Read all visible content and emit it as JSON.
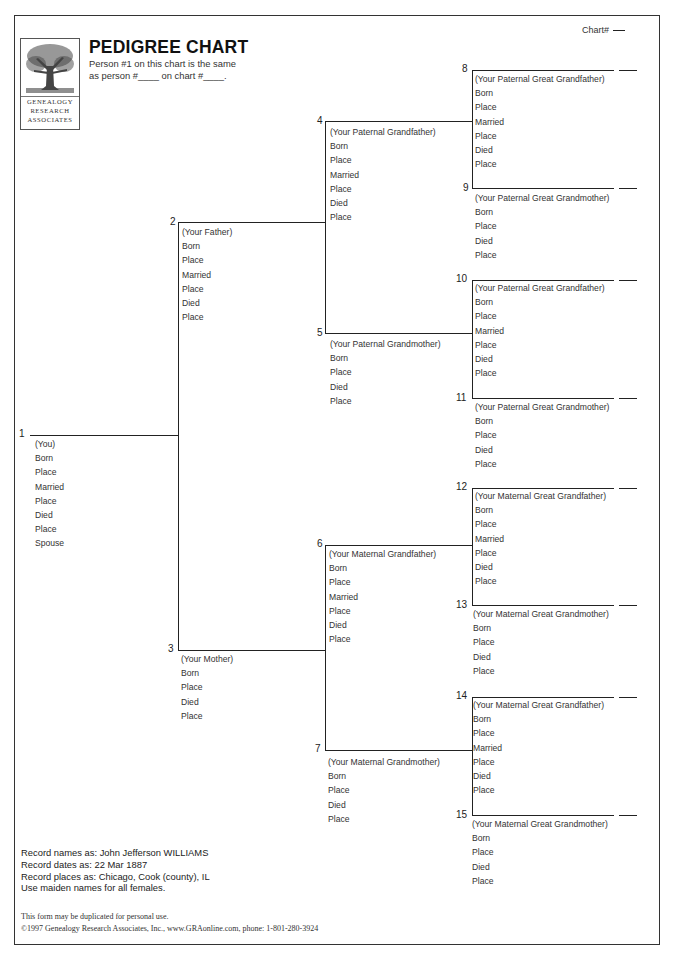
{
  "header": {
    "title": "PEDIGREE CHART",
    "subtitle_line1": "Person #1 on this chart is the same",
    "subtitle_line2": "as person #____ on chart #____.",
    "chart_number_label": "Chart#",
    "logo": {
      "icon": "tree-icon",
      "line1": "GENEALOGY",
      "line2": "RESEARCH",
      "line3": "ASSOCIATES"
    }
  },
  "persons": [
    {
      "num": "1",
      "role": "(You)",
      "fields": [
        "Born",
        "Place",
        "Married",
        "Place",
        "Died",
        "Place",
        "Spouse"
      ]
    },
    {
      "num": "2",
      "role": "(Your Father)",
      "fields": [
        "Born",
        "Place",
        "Married",
        "Place",
        "Died",
        "Place"
      ]
    },
    {
      "num": "3",
      "role": "(Your Mother)",
      "fields": [
        "Born",
        "Place",
        "Died",
        "Place"
      ]
    },
    {
      "num": "4",
      "role": "(Your Paternal Grandfather)",
      "fields": [
        "Born",
        "Place",
        "Married",
        "Place",
        "Died",
        "Place"
      ]
    },
    {
      "num": "5",
      "role": "(Your Paternal Grandmother)",
      "fields": [
        "Born",
        "Place",
        "Died",
        "Place"
      ]
    },
    {
      "num": "6",
      "role": "(Your Maternal Grandfather)",
      "fields": [
        "Born",
        "Place",
        "Married",
        "Place",
        "Died",
        "Place"
      ]
    },
    {
      "num": "7",
      "role": "(Your Maternal Grandmother)",
      "fields": [
        "Born",
        "Place",
        "Died",
        "Place"
      ]
    },
    {
      "num": "8",
      "role": "(Your Paternal Great Grandfather)",
      "fields": [
        "Born",
        "Place",
        "Married",
        "Place",
        "Died",
        "Place"
      ]
    },
    {
      "num": "9",
      "role": "(Your Paternal Great Grandmother)",
      "fields": [
        "Born",
        "Place",
        "Died",
        "Place"
      ]
    },
    {
      "num": "10",
      "role": "(Your Paternal Great Grandfather)",
      "fields": [
        "Born",
        "Place",
        "Married",
        "Place",
        "Died",
        "Place"
      ]
    },
    {
      "num": "11",
      "role": "(Your Paternal Great Grandmother)",
      "fields": [
        "Born",
        "Place",
        "Died",
        "Place"
      ]
    },
    {
      "num": "12",
      "role": "(Your Maternal Great Grandfather)",
      "fields": [
        "Born",
        "Place",
        "Married",
        "Place",
        "Died",
        "Place"
      ]
    },
    {
      "num": "13",
      "role": "(Your Maternal Great Grandmother)",
      "fields": [
        "Born",
        "Place",
        "Died",
        "Place"
      ]
    },
    {
      "num": "14",
      "role": "(Your Maternal Great Grandfather)",
      "fields": [
        "Born",
        "Place",
        "Married",
        "Place",
        "Died",
        "Place"
      ]
    },
    {
      "num": "15",
      "role": "(Your Maternal Great Grandmother)",
      "fields": [
        "Born",
        "Place",
        "Died",
        "Place"
      ]
    }
  ],
  "instructions": [
    "Record names as: John Jefferson WILLIAMS",
    "Record dates as: 22 Mar 1887",
    "Record places as: Chicago, Cook (county), IL",
    "Use maiden names for all females."
  ],
  "footer": {
    "line1": "This form may be duplicated for personal use.",
    "line2": "©1997 Genealogy Research Associates, Inc.,  www.GRAonline.com, phone: 1-801-280-3924"
  }
}
